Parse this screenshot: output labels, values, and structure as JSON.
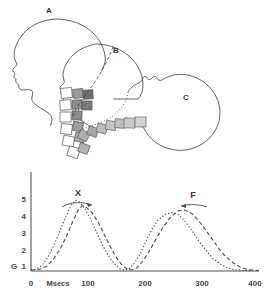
{
  "figure": {
    "head_diagram": {
      "labels": [
        {
          "id": "A",
          "text": "A",
          "x": 49,
          "y": 13
        },
        {
          "id": "B",
          "text": "B",
          "x": 116,
          "y": 53
        },
        {
          "id": "C",
          "text": "C",
          "x": 186,
          "y": 100
        }
      ],
      "vertebra_blocks_note": "two arcs of small squares with graded gray fills representing cervical vertebrae"
    },
    "chart_labels": {
      "curve_x": "X",
      "curve_f": "F"
    }
  },
  "chart_data": {
    "type": "line",
    "title": "",
    "xlabel": "Msecs",
    "ylabel": "G",
    "xlim": [
      0,
      400
    ],
    "ylim": [
      0,
      5.6
    ],
    "xticks": [
      0,
      100,
      200,
      300,
      400
    ],
    "yticks": [
      1,
      2,
      3,
      4,
      5
    ],
    "grid": false,
    "legend": "none",
    "annotations": [
      {
        "text": "X",
        "x": 78,
        "y": 5.0,
        "arrow": "right"
      },
      {
        "text": "F",
        "x": 265,
        "y": 4.9,
        "arrow": "left"
      }
    ],
    "series": [
      {
        "name": "X",
        "style": "dotted",
        "points": [
          [
            0,
            0.05
          ],
          [
            10,
            0.12
          ],
          [
            20,
            0.35
          ],
          [
            30,
            0.8
          ],
          [
            40,
            1.45
          ],
          [
            50,
            2.2
          ],
          [
            60,
            3.0
          ],
          [
            70,
            3.7
          ],
          [
            78,
            4.0
          ],
          [
            85,
            3.9
          ],
          [
            95,
            3.5
          ],
          [
            105,
            2.9
          ],
          [
            115,
            2.2
          ],
          [
            125,
            1.5
          ],
          [
            135,
            0.9
          ],
          [
            145,
            0.45
          ],
          [
            155,
            0.15
          ],
          [
            163,
            0.05
          ],
          [
            172,
            0.12
          ],
          [
            182,
            0.45
          ],
          [
            192,
            1.0
          ],
          [
            202,
            1.7
          ],
          [
            212,
            2.35
          ],
          [
            222,
            2.85
          ],
          [
            235,
            3.2
          ],
          [
            248,
            3.3
          ],
          [
            258,
            3.2
          ],
          [
            268,
            2.9
          ],
          [
            280,
            2.4
          ],
          [
            292,
            1.8
          ],
          [
            305,
            1.25
          ],
          [
            318,
            0.75
          ],
          [
            332,
            0.4
          ],
          [
            345,
            0.18
          ],
          [
            358,
            0.07
          ],
          [
            370,
            0.03
          ],
          [
            385,
            0.02
          ]
        ]
      },
      {
        "name": "F",
        "style": "dashed",
        "points": [
          [
            0,
            0.04
          ],
          [
            15,
            0.1
          ],
          [
            28,
            0.28
          ],
          [
            40,
            0.7
          ],
          [
            52,
            1.3
          ],
          [
            62,
            1.95
          ],
          [
            72,
            2.7
          ],
          [
            82,
            3.4
          ],
          [
            90,
            3.7
          ],
          [
            97,
            3.6
          ],
          [
            107,
            3.3
          ],
          [
            118,
            2.75
          ],
          [
            128,
            2.1
          ],
          [
            138,
            1.45
          ],
          [
            148,
            0.85
          ],
          [
            158,
            0.4
          ],
          [
            168,
            0.12
          ],
          [
            176,
            0.06
          ],
          [
            186,
            0.18
          ],
          [
            196,
            0.55
          ],
          [
            208,
            1.15
          ],
          [
            220,
            1.85
          ],
          [
            232,
            2.5
          ],
          [
            245,
            3.05
          ],
          [
            258,
            3.4
          ],
          [
            270,
            3.45
          ],
          [
            282,
            3.25
          ],
          [
            294,
            2.85
          ],
          [
            306,
            2.35
          ],
          [
            318,
            1.8
          ],
          [
            330,
            1.25
          ],
          [
            342,
            0.8
          ],
          [
            355,
            0.45
          ],
          [
            368,
            0.2
          ],
          [
            380,
            0.08
          ],
          [
            392,
            0.04
          ],
          [
            400,
            0.03
          ]
        ]
      }
    ]
  }
}
